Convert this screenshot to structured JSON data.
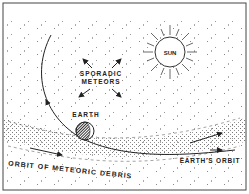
{
  "diagram": {
    "labels": {
      "sun": "SUN",
      "sporadic_line1": "SPORADIC",
      "sporadic_line2": "METEORS",
      "earth": "EARTH",
      "debris_orbit": "ORBIT OF METEORIC DEBRIS",
      "earth_orbit": "EARTH'S ORBIT"
    },
    "colors": {
      "ink": "#222222",
      "background": "#ffffff",
      "stipple": "#555555"
    }
  }
}
